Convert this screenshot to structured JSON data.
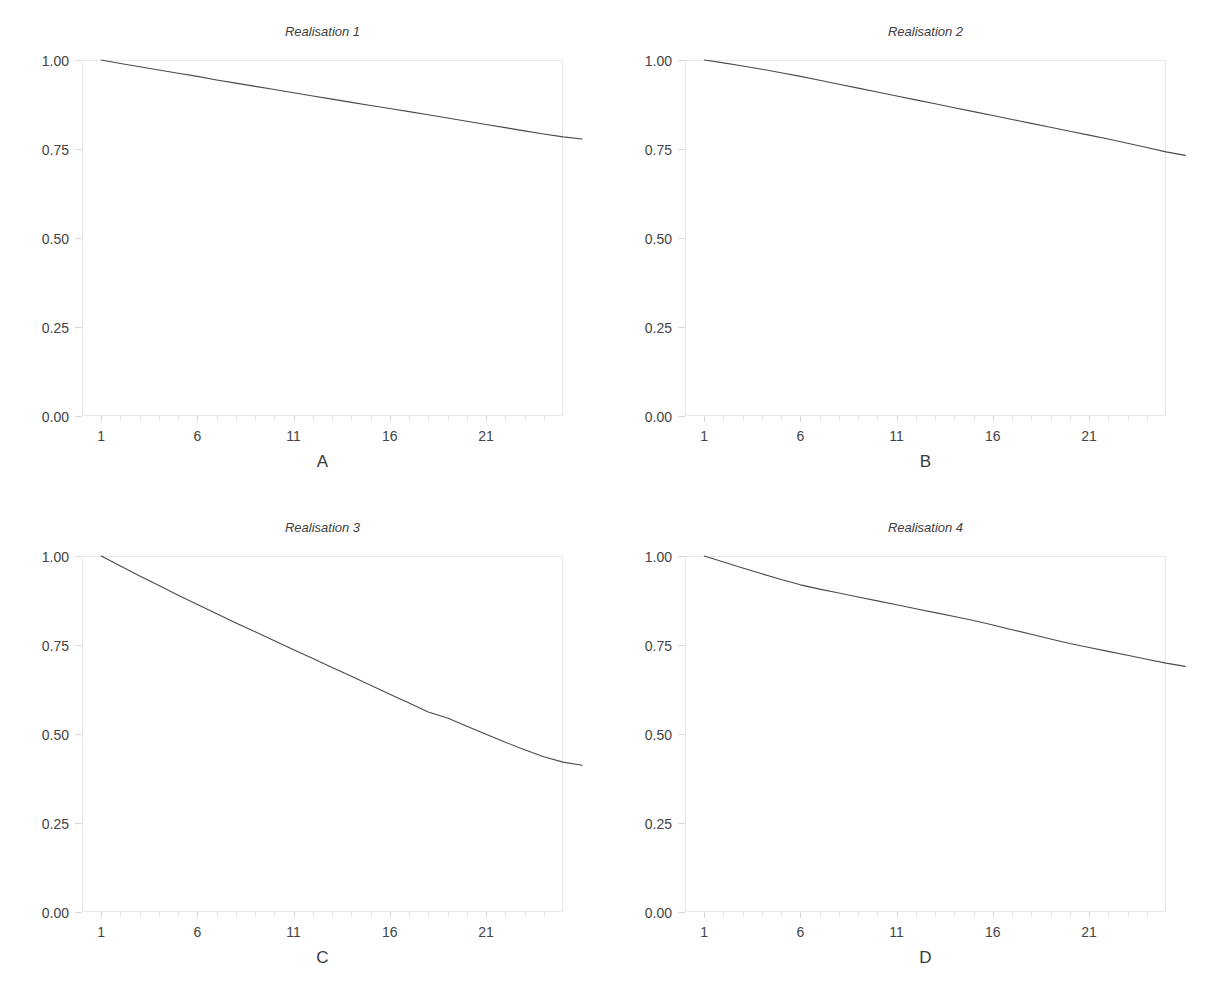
{
  "figure": {
    "background": "#ffffff",
    "line_color": "#4a4a4a",
    "border_color": "#e9e9ec",
    "tick_color": "#d8d8dc",
    "text_color": "#404040",
    "rows": 2,
    "cols": 2
  },
  "chart_data": [
    {
      "type": "line",
      "title": "Realisation 1",
      "xlabel": "A",
      "ylabel": "",
      "xlim": [
        0,
        25
      ],
      "ylim": [
        0.0,
        1.0
      ],
      "grid": false,
      "legend": "none",
      "xticks": [
        1,
        6,
        11,
        16,
        21
      ],
      "xtick_labels": [
        "1",
        "6",
        "11",
        "16",
        "21"
      ],
      "yticks": [
        0.0,
        0.25,
        0.5,
        0.75,
        1.0
      ],
      "ytick_labels": [
        "0.00",
        "0.25",
        "0.50",
        "0.75",
        "1.00"
      ],
      "x": [
        1,
        2,
        3,
        4,
        5,
        6,
        7,
        8,
        9,
        10,
        11,
        12,
        13,
        14,
        15,
        16,
        17,
        18,
        19,
        20,
        21,
        22,
        23,
        24,
        25,
        26
      ],
      "y": [
        1.0,
        0.99,
        0.981,
        0.972,
        0.963,
        0.954,
        0.944,
        0.935,
        0.926,
        0.917,
        0.908,
        0.899,
        0.89,
        0.881,
        0.872,
        0.864,
        0.855,
        0.846,
        0.837,
        0.828,
        0.819,
        0.81,
        0.801,
        0.792,
        0.784,
        0.778
      ]
    },
    {
      "type": "line",
      "title": "Realisation 2",
      "xlabel": "B",
      "ylabel": "",
      "xlim": [
        0,
        25
      ],
      "ylim": [
        0.0,
        1.0
      ],
      "grid": false,
      "legend": "none",
      "xticks": [
        1,
        6,
        11,
        16,
        21
      ],
      "xtick_labels": [
        "1",
        "6",
        "11",
        "16",
        "21"
      ],
      "yticks": [
        0.0,
        0.25,
        0.5,
        0.75,
        1.0
      ],
      "ytick_labels": [
        "0.00",
        "0.25",
        "0.50",
        "0.75",
        "1.00"
      ],
      "x": [
        1,
        2,
        3,
        4,
        5,
        6,
        7,
        8,
        9,
        10,
        11,
        12,
        13,
        14,
        15,
        16,
        17,
        18,
        19,
        20,
        21,
        22,
        23,
        24,
        25,
        26
      ],
      "y": [
        1.0,
        0.992,
        0.983,
        0.974,
        0.964,
        0.954,
        0.943,
        0.932,
        0.921,
        0.91,
        0.899,
        0.888,
        0.877,
        0.866,
        0.855,
        0.844,
        0.833,
        0.822,
        0.811,
        0.8,
        0.789,
        0.778,
        0.766,
        0.754,
        0.742,
        0.732
      ]
    },
    {
      "type": "line",
      "title": "Realisation 3",
      "xlabel": "C",
      "ylabel": "",
      "xlim": [
        0,
        25
      ],
      "ylim": [
        0.0,
        1.0
      ],
      "grid": false,
      "legend": "none",
      "xticks": [
        1,
        6,
        11,
        16,
        21
      ],
      "xtick_labels": [
        "1",
        "6",
        "11",
        "16",
        "21"
      ],
      "yticks": [
        0.0,
        0.25,
        0.5,
        0.75,
        1.0
      ],
      "ytick_labels": [
        "0.00",
        "0.25",
        "0.50",
        "0.75",
        "1.00"
      ],
      "x": [
        1,
        2,
        3,
        4,
        5,
        6,
        7,
        8,
        9,
        10,
        11,
        12,
        13,
        14,
        15,
        16,
        17,
        18,
        19,
        20,
        21,
        22,
        23,
        24,
        25,
        26
      ],
      "y": [
        1.0,
        0.972,
        0.944,
        0.917,
        0.89,
        0.864,
        0.838,
        0.812,
        0.787,
        0.762,
        0.737,
        0.712,
        0.687,
        0.662,
        0.637,
        0.612,
        0.587,
        0.562,
        0.545,
        0.522,
        0.499,
        0.477,
        0.456,
        0.436,
        0.421,
        0.412
      ]
    },
    {
      "type": "line",
      "title": "Realisation 4",
      "xlabel": "D",
      "ylabel": "",
      "xlim": [
        0,
        25
      ],
      "ylim": [
        0.0,
        1.0
      ],
      "grid": false,
      "legend": "none",
      "xticks": [
        1,
        6,
        11,
        16,
        21
      ],
      "xtick_labels": [
        "1",
        "6",
        "11",
        "16",
        "21"
      ],
      "yticks": [
        0.0,
        0.25,
        0.5,
        0.75,
        1.0
      ],
      "ytick_labels": [
        "0.00",
        "0.25",
        "0.50",
        "0.75",
        "1.00"
      ],
      "x": [
        1,
        2,
        3,
        4,
        5,
        6,
        7,
        8,
        9,
        10,
        11,
        12,
        13,
        14,
        15,
        16,
        17,
        18,
        19,
        20,
        21,
        22,
        23,
        24,
        25,
        26
      ],
      "y": [
        1.0,
        0.983,
        0.966,
        0.95,
        0.934,
        0.919,
        0.907,
        0.896,
        0.885,
        0.874,
        0.863,
        0.852,
        0.841,
        0.83,
        0.819,
        0.806,
        0.793,
        0.78,
        0.767,
        0.754,
        0.743,
        0.732,
        0.721,
        0.71,
        0.699,
        0.69
      ]
    }
  ]
}
